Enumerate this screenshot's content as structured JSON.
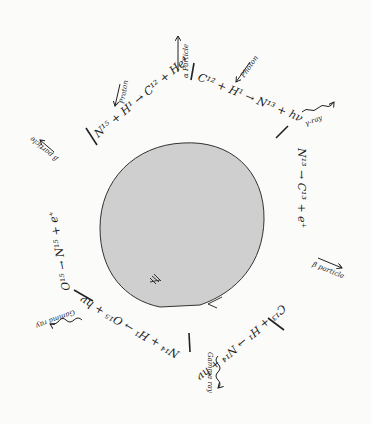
{
  "core": {
    "fill": "#cfcfcf",
    "stroke": "#333333"
  },
  "reactions": [
    {
      "id": "r1",
      "text": "N¹⁵ + H¹ → C¹² + He⁴",
      "input_label": "Proton",
      "output_label": "α Particle"
    },
    {
      "id": "r2",
      "text": "C¹² + H¹ → N¹³ + hν",
      "input_label": "Photon",
      "output_label": "γ-ray"
    },
    {
      "id": "r3",
      "text": "N¹³ → C¹³ + e⁺",
      "output_label": "β particle"
    },
    {
      "id": "r4",
      "text": "C¹³ + H¹ → N¹⁴ + hν",
      "output_label": "Gamma ray"
    },
    {
      "id": "r5",
      "text": "N¹⁴ + H¹ → O¹⁵ + hν",
      "output_label": "Gamma ray"
    },
    {
      "id": "r6",
      "text": "O¹⁵ → N¹⁵ + e⁺",
      "output_label": "β particle"
    }
  ]
}
